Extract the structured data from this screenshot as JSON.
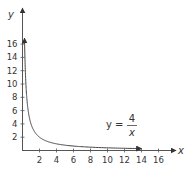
{
  "chart_data": {
    "type": "line",
    "title": "",
    "xlabel": "x",
    "ylabel": "y",
    "xlim": [
      0,
      17
    ],
    "ylim": [
      0,
      19
    ],
    "grid": false,
    "x_ticks": [
      "2",
      "4",
      "6",
      "8",
      "10",
      "12",
      "14",
      "16"
    ],
    "y_ticks": [
      "2",
      "4",
      "6",
      "8",
      "10",
      "12",
      "14",
      "16"
    ],
    "annotation": {
      "lhs": "y =",
      "numerator": "4",
      "denominator": "x"
    },
    "series": [
      {
        "name": "y = 4/x",
        "x": [
          0.24,
          0.3,
          0.4,
          0.5,
          0.75,
          1,
          1.5,
          2,
          3,
          4,
          6,
          8,
          10,
          12,
          14
        ],
        "y": [
          16.67,
          13.33,
          10,
          8,
          5.33,
          4,
          2.67,
          2,
          1.33,
          1,
          0.67,
          0.5,
          0.4,
          0.33,
          0.29
        ]
      }
    ]
  }
}
